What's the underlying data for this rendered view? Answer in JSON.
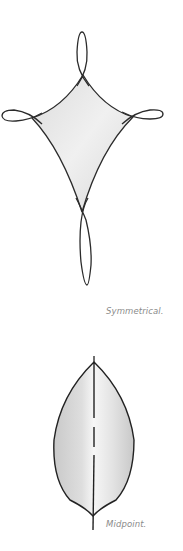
{
  "figures": [
    {
      "id": "symmetrical",
      "shape": "four-pointed curved diamond with looped ends",
      "caption": "Symmetrical."
    },
    {
      "id": "midpoint",
      "shape": "leaf with dashed center line",
      "caption": "Midpoint."
    }
  ],
  "colors": {
    "stroke": "#2b2b2b",
    "fill_light": "#ececec",
    "fill_mid": "#d6d6d6",
    "caption": "#8a8a8a",
    "background": "#ffffff"
  }
}
